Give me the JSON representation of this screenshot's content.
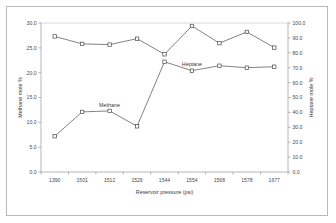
{
  "chart_data": {
    "type": "line",
    "title": "",
    "subtitle": "",
    "xlabel": "Reservoir pressure (psi)",
    "ylabel": "Methane mole %",
    "y2label": "Heptane mole %",
    "grid": false,
    "legend_position": "inline-annotation",
    "categories": [
      "1390",
      "1501",
      "1512",
      "1529",
      "1544",
      "1554",
      "1568",
      "1578",
      "1677"
    ],
    "xtick_labels": [
      "1390",
      "1501",
      "1512",
      "1529",
      "1544",
      "1554",
      "1568",
      "1578",
      "1677"
    ],
    "ylim": [
      0.0,
      30.0
    ],
    "ytick_labels": [
      "0.0",
      "5.0",
      "10.0",
      "15.0",
      "20.0",
      "25.0",
      "30.0"
    ],
    "ytick_values": [
      0.0,
      5.0,
      10.0,
      15.0,
      20.0,
      25.0,
      30.0
    ],
    "y2lim": [
      0.0,
      100.0
    ],
    "y2tick_labels": [
      "0.0",
      "10.0",
      "20.0",
      "30.0",
      "40.0",
      "50.0",
      "60.0",
      "70.0",
      "80.0",
      "90.0",
      "100.0"
    ],
    "y2tick_values": [
      0.0,
      10.0,
      20.0,
      30.0,
      40.0,
      50.0,
      60.0,
      70.0,
      80.0,
      90.0,
      100.0
    ],
    "series": [
      {
        "name": "Methane",
        "axis": "left",
        "label_text": "Methane",
        "marker": "square",
        "color": "#4a4a4a",
        "values": [
          7.2,
          12.1,
          12.3,
          9.2,
          22.2,
          20.4,
          21.4,
          21.0,
          21.2
        ]
      },
      {
        "name": "Heptane",
        "axis": "right",
        "label_text": "Heptane",
        "marker": "square",
        "color": "#4a4a4a",
        "values": [
          91.0,
          86.0,
          85.5,
          89.5,
          79.0,
          98.0,
          86.5,
          94.0,
          83.5
        ]
      }
    ],
    "annotations": [
      {
        "text": "Methane",
        "x_category": "1512",
        "value": 12.3,
        "axis": "left"
      },
      {
        "text": "Heptane",
        "x_category": "1554",
        "value": 20.4,
        "axis": "left"
      }
    ]
  },
  "colors": {
    "background": "#ffffff",
    "frame": "#b9b9b9",
    "axis": "#9a9a9a",
    "line": "#5a5a5a",
    "text": "#3c3c3c"
  }
}
